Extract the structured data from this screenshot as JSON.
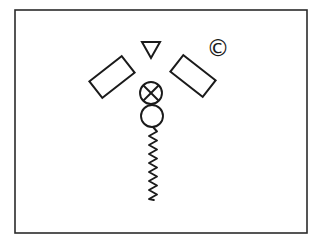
{
  "figure": {
    "background_color": "#ffffff",
    "stroke_color": "#1a1a1a",
    "frame": {
      "label": "image border",
      "color": "#2b2b2b",
      "x": 15,
      "y": 10,
      "width": 292,
      "height": 223
    },
    "shapes": [
      {
        "id": "triangle-down",
        "name": "down-triangle",
        "kind": "triangle",
        "orientation": "pointing-down",
        "cx": 151,
        "cy": 50,
        "width": 18,
        "height": 16
      },
      {
        "id": "copyright-mark",
        "name": "copyright-symbol",
        "kind": "glyph",
        "glyph": "©",
        "cx": 218,
        "cy": 48,
        "size": 23
      },
      {
        "id": "rect-left",
        "name": "left-tilted-rectangle",
        "kind": "rectangle",
        "cx": 112,
        "cy": 77,
        "width": 41,
        "height": 21,
        "rotation_deg": -38
      },
      {
        "id": "rect-right",
        "name": "right-tilted-rectangle",
        "kind": "rectangle",
        "cx": 193,
        "cy": 76,
        "width": 41,
        "height": 21,
        "rotation_deg": 38
      },
      {
        "id": "circle-x",
        "name": "crossed-circle",
        "kind": "circle-with-x",
        "cx": 151,
        "cy": 93,
        "r": 11
      },
      {
        "id": "circle-plain",
        "name": "plain-circle",
        "kind": "circle",
        "cx": 152,
        "cy": 116,
        "r": 11
      },
      {
        "id": "squiggle-tail",
        "name": "zigzag-tail",
        "kind": "zigzag-line",
        "x_center": 153,
        "y_start": 127,
        "y_end": 200,
        "amplitude": 4,
        "wavelength": 9
      }
    ]
  }
}
